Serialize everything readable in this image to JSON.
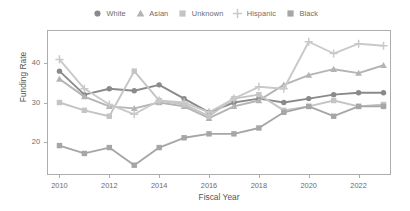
{
  "chart_data": {
    "type": "line",
    "title": "",
    "xlabel": "Fiscal Year",
    "ylabel": "Funding Rate",
    "x": [
      2010,
      2011,
      2012,
      2013,
      2014,
      2015,
      2016,
      2017,
      2018,
      2019,
      2020,
      2021,
      2022,
      2023
    ],
    "xlim": [
      2009.5,
      2023.3
    ],
    "ylim": [
      11.5,
      48.5
    ],
    "xticks": [
      2010,
      2012,
      2014,
      2016,
      2018,
      2020,
      2022
    ],
    "yticks": [
      20,
      30,
      40
    ],
    "grid": false,
    "legend_position": "top-center",
    "series": [
      {
        "name": "White",
        "marker": "circle",
        "color": "#8a8a8a",
        "values": [
          38.0,
          32.0,
          33.5,
          33.0,
          34.5,
          31.0,
          27.5,
          30.0,
          31.0,
          30.0,
          31.0,
          32.0,
          32.5,
          32.5
        ]
      },
      {
        "name": "Asian",
        "marker": "triangle",
        "color": "#b4b4b4",
        "values": [
          36.0,
          31.5,
          29.0,
          28.5,
          30.0,
          29.0,
          26.0,
          29.0,
          30.5,
          34.5,
          37.0,
          38.5,
          37.5,
          39.5
        ]
      },
      {
        "name": "Unknown",
        "marker": "square",
        "color": "#c4c4c4",
        "values": [
          30.0,
          28.0,
          26.5,
          38.0,
          30.5,
          29.5,
          26.5,
          31.0,
          32.0,
          28.0,
          29.0,
          30.5,
          29.0,
          29.5
        ]
      },
      {
        "name": "Hispanic",
        "marker": "plus",
        "color": "#c9c9c9",
        "values": [
          41.0,
          33.5,
          29.5,
          27.0,
          30.5,
          30.0,
          27.5,
          31.0,
          34.0,
          33.5,
          45.5,
          42.5,
          45.0,
          44.5
        ]
      },
      {
        "name": "Black",
        "marker": "square",
        "color": "#a6a6a6",
        "values": [
          19.0,
          17.0,
          18.5,
          14.0,
          18.5,
          21.0,
          22.0,
          22.0,
          23.5,
          27.5,
          29.0,
          26.5,
          29.0,
          29.0
        ]
      }
    ]
  },
  "axes": {
    "y_title": "Funding Rate",
    "x_title": "Fiscal Year",
    "y_tick_labels": [
      "20",
      "30",
      "40"
    ],
    "x_tick_labels": [
      "2010",
      "2012",
      "2014",
      "2016",
      "2018",
      "2020",
      "2022"
    ]
  },
  "legend": {
    "items": [
      {
        "label": "White",
        "icon": "circle-marker-icon"
      },
      {
        "label": "Asian",
        "icon": "triangle-marker-icon"
      },
      {
        "label": "Unknown",
        "icon": "square-marker-icon"
      },
      {
        "label": "Hispanic",
        "icon": "plus-marker-icon"
      },
      {
        "label": "Black",
        "icon": "square-marker-icon"
      }
    ]
  }
}
